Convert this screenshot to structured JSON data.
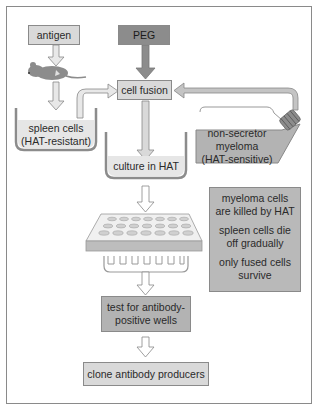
{
  "diagram": {
    "nodes": {
      "antigen": "antigen",
      "peg": "PEG",
      "cell_fusion": "cell fusion",
      "spleen_cells_line1": "spleen cells",
      "spleen_cells_line2": "(HAT-resistant)",
      "myeloma_line1": "non-secretor",
      "myeloma_line2": "myeloma",
      "myeloma_line3": "(HAT-sensitive)",
      "culture": "culture in HAT",
      "test_line1": "test for antibody-",
      "test_line2": "positive wells",
      "clone": "clone antibody producers"
    },
    "notes": [
      "myeloma cells are killed by HAT",
      "spleen cells die off gradually",
      "only fused cells survive"
    ],
    "icons": [
      "mouse-icon",
      "beaker-icon",
      "flask-icon",
      "well-plate-icon",
      "comb-icon"
    ],
    "colors": {
      "light_box": "#d9d9d9",
      "mid_box": "#b3b3b3",
      "dark_box": "#8c8c8c",
      "border": "#8a8a8a"
    }
  }
}
